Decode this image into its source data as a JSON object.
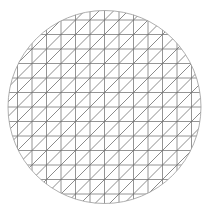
{
  "figure": {
    "type": "triangulated-disk-mesh",
    "width": 209,
    "height": 212,
    "background": "#ffffff",
    "line_color": "#7a7a7a",
    "diagonal_color": "#6e6e6e",
    "boundary_color": "#9a9a9a",
    "circle": {
      "cx": 104.5,
      "cy": 107,
      "r": 96.5
    },
    "grid": {
      "origin_x": 104.5,
      "origin_y": 107,
      "spacing": 14.5,
      "cells_per_radius": 7,
      "diagonal_direction": "bottom-left-to-top-right"
    }
  }
}
